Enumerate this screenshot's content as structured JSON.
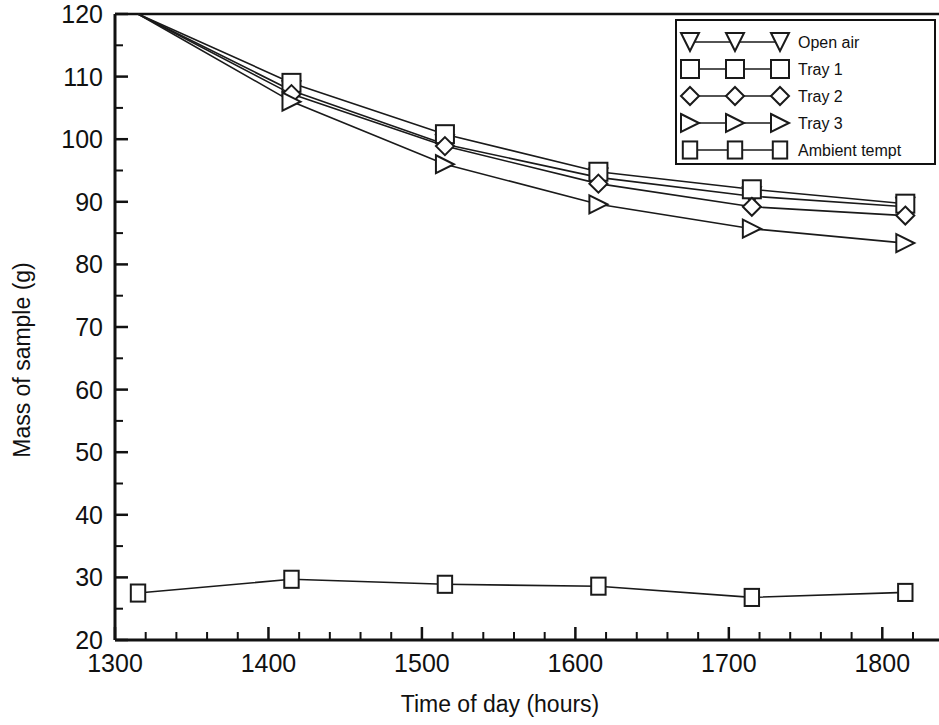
{
  "chart_data": {
    "type": "line",
    "title": "",
    "xlabel": "Time of day (hours)",
    "ylabel": "Mass of sample (g)",
    "xlim": [
      1300,
      1835
    ],
    "ylim": [
      20,
      120
    ],
    "xticks": [
      1300,
      1400,
      1500,
      1600,
      1700,
      1800
    ],
    "yticks": [
      20,
      30,
      40,
      50,
      60,
      70,
      80,
      90,
      100,
      110,
      120
    ],
    "x_minor_per_interval": 5,
    "y_minor_per_interval": 2,
    "grid": false,
    "legend_position": "top-right",
    "x": [
      1315,
      1415,
      1515,
      1615,
      1715,
      1815
    ],
    "series": [
      {
        "name": "Open air",
        "marker": "triangle-down",
        "values": [
          120.0,
          107.8,
          99.2,
          93.9,
          90.9,
          89.2
        ]
      },
      {
        "name": "Tray 1",
        "marker": "square",
        "values": [
          120.0,
          109.0,
          100.8,
          94.8,
          92.0,
          89.7
        ]
      },
      {
        "name": "Tray 2",
        "marker": "diamond",
        "values": [
          120.0,
          107.2,
          98.9,
          92.9,
          89.2,
          87.8
        ]
      },
      {
        "name": "Tray 3",
        "marker": "triangle-right",
        "values": [
          120.0,
          106.0,
          96.0,
          89.6,
          85.7,
          83.4
        ]
      },
      {
        "name": "Ambient tempt",
        "marker": "square-small",
        "values": [
          27.5,
          29.7,
          28.9,
          28.6,
          26.8,
          27.6
        ]
      }
    ]
  },
  "legend": {
    "entries": [
      {
        "label": "Open air",
        "marker": "triangle-down"
      },
      {
        "label": "Tray 1",
        "marker": "square"
      },
      {
        "label": "Tray 2",
        "marker": "diamond"
      },
      {
        "label": "Tray 3",
        "marker": "triangle-right"
      },
      {
        "label": "Ambient tempt",
        "marker": "square-small"
      }
    ]
  },
  "colors": {
    "line": "#1a1a1a",
    "marker_fill": "#ffffff",
    "axis": "#111111",
    "background": "#ffffff"
  }
}
